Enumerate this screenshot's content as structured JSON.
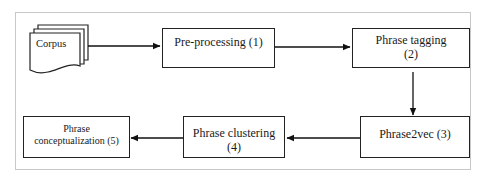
{
  "diagram": {
    "nodes": {
      "corpus": {
        "label": "Corpus",
        "shape": "document-stack"
      },
      "preprocessing": {
        "line1": "Pre-processing (1)",
        "line2": ""
      },
      "phrase_tagging": {
        "line1": "Phrase tagging",
        "line2": "(2)"
      },
      "phrase2vec": {
        "line1": "Phrase2vec (3)",
        "line2": ""
      },
      "phrase_clustering": {
        "line1": "Phrase clustering",
        "line2": "(4)"
      },
      "phrase_conceptualization": {
        "line1": "Phrase",
        "line2": "conceptualization (5)"
      }
    },
    "edges": [
      {
        "from": "Corpus",
        "to": "Pre-processing (1)"
      },
      {
        "from": "Pre-processing (1)",
        "to": "Phrase tagging (2)"
      },
      {
        "from": "Phrase tagging (2)",
        "to": "Phrase2vec (3)"
      },
      {
        "from": "Phrase2vec (3)",
        "to": "Phrase clustering (4)"
      },
      {
        "from": "Phrase clustering (4)",
        "to": "Phrase conceptualization (5)"
      }
    ],
    "colors": {
      "stroke": "#222222",
      "frame": "#c8c8c8",
      "background": "#ffffff"
    }
  }
}
